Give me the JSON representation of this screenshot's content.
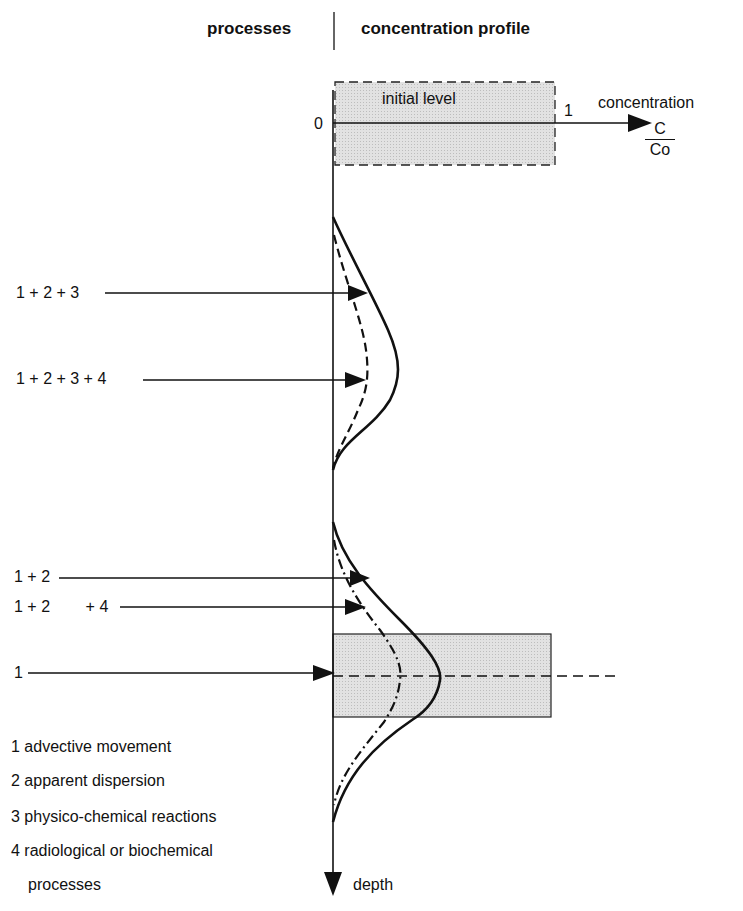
{
  "header": {
    "left_title": "processes",
    "right_title": "concentration profile"
  },
  "axes": {
    "origin_label": "0",
    "x_tick_label": "1",
    "x_axis_label": "concentration",
    "x_axis_fraction": {
      "numerator": "C",
      "denominator": "Co"
    },
    "y_axis_label": "depth"
  },
  "initial_box": {
    "label": "initial level"
  },
  "process_arrows": [
    {
      "label": "1 + 2 + 3",
      "curve": "upper-solid"
    },
    {
      "label": "1 + 2 + 3 + 4",
      "curve": "upper-dashed"
    },
    {
      "label": "1 + 2",
      "curve": "lower-solid"
    },
    {
      "label": "1 + 2        + 4",
      "curve": "lower-dashed"
    },
    {
      "label": "1",
      "curve": "advective-front"
    }
  ],
  "legend": [
    {
      "number": "1",
      "text": "advective movement"
    },
    {
      "number": "2",
      "text": "apparent dispersion"
    },
    {
      "number": "3",
      "text": "physico-chemical reactions"
    },
    {
      "number": "4",
      "text": "radiological or biochemical"
    },
    {
      "number": "",
      "text": "processes"
    }
  ],
  "colors": {
    "ink": "#111111",
    "box_fill": "#d9d9d9",
    "background": "#ffffff"
  }
}
